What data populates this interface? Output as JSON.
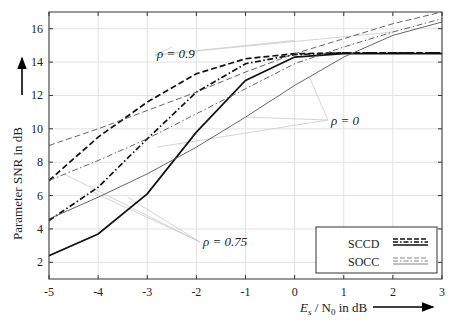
{
  "chart_data": {
    "type": "line",
    "title": "",
    "xlabel": "E_s / N_0 in dB",
    "ylabel": "Parameter SNR in dB",
    "xlim": [
      -5,
      3
    ],
    "ylim": [
      1,
      17
    ],
    "xticks": [
      -5,
      -4,
      -3,
      -2,
      -1,
      0,
      1,
      2,
      3
    ],
    "xtick_labels": [
      "-5",
      "-4",
      "-3",
      "-2",
      "-1",
      "0",
      "1",
      "2",
      "3"
    ],
    "yticks": [
      2,
      4,
      6,
      8,
      10,
      12,
      14,
      16
    ],
    "ytick_labels": [
      "2",
      "4",
      "6",
      "8",
      "10",
      "12",
      "14",
      "16"
    ],
    "grid": true,
    "legend": {
      "position": "lower right",
      "entries": [
        "SCCD",
        "SOCC"
      ]
    },
    "annotations": [
      "ρ = 0.9",
      "ρ = 0",
      "ρ = 0.75"
    ],
    "x": [
      -5,
      -4,
      -3,
      -2,
      -1,
      0,
      1,
      2,
      3
    ],
    "series": [
      {
        "name": "SCCD ρ=0.9",
        "style": "thick-dashed",
        "values": [
          6.9,
          9.5,
          11.6,
          13.3,
          14.2,
          14.5,
          14.55,
          14.55,
          14.55
        ]
      },
      {
        "name": "SCCD ρ=0.75",
        "style": "thick-dashdot",
        "values": [
          4.5,
          6.5,
          9.4,
          12.2,
          13.9,
          14.45,
          14.55,
          14.55,
          14.55
        ]
      },
      {
        "name": "SCCD ρ=0",
        "style": "thick-solid",
        "values": [
          2.4,
          3.7,
          6.1,
          9.8,
          12.9,
          14.3,
          14.5,
          14.5,
          14.5
        ]
      },
      {
        "name": "SOCC ρ=0.9",
        "style": "thin-dashed",
        "values": [
          9.0,
          10.0,
          11.1,
          12.2,
          13.4,
          14.5,
          15.4,
          16.3,
          17.0
        ]
      },
      {
        "name": "SOCC ρ=0.75",
        "style": "thin-dashdot",
        "values": [
          6.9,
          8.1,
          9.4,
          10.9,
          12.4,
          13.9,
          14.9,
          15.8,
          16.6
        ]
      },
      {
        "name": "SOCC ρ=0",
        "style": "thin-solid",
        "values": [
          4.6,
          5.9,
          7.3,
          8.9,
          10.7,
          12.6,
          14.3,
          15.6,
          16.4
        ]
      }
    ]
  },
  "labels": {
    "ylabel": "Parameter SNR in dB",
    "xlabel_E": "E",
    "xlabel_s": "s",
    "xlabel_slash": " / N",
    "xlabel_0": "0",
    "xlabel_tail": " in dB",
    "rho09": "ρ = 0.9",
    "rho0": "ρ = 0",
    "rho075": "ρ = 0.75",
    "legend_sccd": "SCCD",
    "legend_socc": "SOCC"
  }
}
